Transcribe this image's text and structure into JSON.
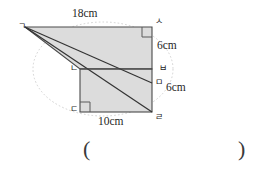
{
  "figure": {
    "type": "geometry-diagram",
    "fill_color": "#dcdcdc",
    "stroke_color": "#4a4a4a",
    "guide_color": "#c9c9c9"
  },
  "vertices": [
    {
      "id": "g",
      "label": "ㄱ",
      "x": 18,
      "y": 22
    },
    {
      "id": "s",
      "label": "ㅅ",
      "x": 155,
      "y": 17
    },
    {
      "id": "b",
      "label": "ㅂ",
      "x": 159,
      "y": 64
    },
    {
      "id": "m",
      "label": "ㅁ",
      "x": 155,
      "y": 78
    },
    {
      "id": "r",
      "label": "ㄹ",
      "x": 155,
      "y": 113
    },
    {
      "id": "n",
      "label": "ㄴ",
      "x": 70,
      "y": 64
    },
    {
      "id": "d",
      "label": "ㄷ",
      "x": 70,
      "y": 105
    }
  ],
  "measures": [
    {
      "id": "top",
      "label": "18cm",
      "x": 72,
      "y": 8
    },
    {
      "id": "right1",
      "label": "6cm",
      "x": 157,
      "y": 40
    },
    {
      "id": "right2",
      "label": "6cm",
      "x": 166,
      "y": 82
    },
    {
      "id": "bottom",
      "label": "10cm",
      "x": 98,
      "y": 116
    }
  ],
  "answer_field": {
    "open_paren": "(",
    "close_paren": ")",
    "open_x": 83,
    "close_x": 238,
    "y": 138
  },
  "geometry": {
    "apex": {
      "x": 25,
      "y": 27
    },
    "top_right": {
      "x": 152,
      "y": 27
    },
    "mid_right_b": {
      "x": 152,
      "y": 69
    },
    "mid_right_m": {
      "x": 152,
      "y": 83
    },
    "bottom_right": {
      "x": 152,
      "y": 112
    },
    "rect_left_top": {
      "x": 80,
      "y": 69
    },
    "rect_left_bottom": {
      "x": 80,
      "y": 112
    }
  }
}
